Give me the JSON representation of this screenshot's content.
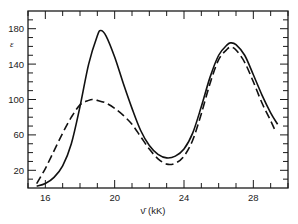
{
  "chart_data": {
    "type": "line",
    "title": "",
    "xlabel": "ν̄ (kK)",
    "ylabel": "ε",
    "xlim": [
      15.0,
      30.0
    ],
    "ylim": [
      0,
      200
    ],
    "xticks_major": [
      16,
      20,
      24,
      28
    ],
    "xticks_minor_step": 1,
    "yticks_major": [
      20,
      60,
      100,
      140,
      180
    ],
    "yticks_minor_step": 10,
    "grid": false,
    "legend": null,
    "series": [
      {
        "name": "solid",
        "style": "solid",
        "x": [
          15.5,
          16.0,
          16.5,
          17.0,
          17.5,
          18.0,
          18.5,
          19.0,
          19.2,
          19.5,
          20.0,
          20.5,
          21.0,
          21.5,
          22.0,
          22.5,
          23.0,
          23.5,
          24.0,
          24.5,
          25.0,
          25.5,
          26.0,
          26.5,
          26.7,
          27.0,
          27.5,
          28.0,
          28.5,
          29.0,
          29.4
        ],
        "y": [
          2,
          5,
          12,
          25,
          50,
          92,
          140,
          172,
          178,
          172,
          148,
          118,
          90,
          65,
          48,
          38,
          34,
          36,
          44,
          62,
          92,
          125,
          150,
          162,
          164,
          162,
          150,
          128,
          105,
          85,
          72
        ]
      },
      {
        "name": "dashed",
        "style": "dashed",
        "x": [
          15.5,
          16.0,
          16.5,
          17.0,
          17.5,
          18.0,
          18.5,
          18.7,
          19.0,
          19.5,
          20.0,
          20.5,
          21.0,
          21.5,
          22.0,
          22.5,
          23.0,
          23.5,
          24.0,
          24.5,
          25.0,
          25.5,
          26.0,
          26.5,
          26.7,
          27.0,
          27.5,
          28.0,
          28.5,
          29.0,
          29.3
        ],
        "y": [
          5,
          22,
          42,
          62,
          80,
          94,
          99,
          100,
          99,
          96,
          90,
          82,
          72,
          58,
          44,
          33,
          27,
          28,
          36,
          54,
          84,
          118,
          145,
          157,
          159,
          156,
          142,
          120,
          96,
          76,
          63
        ]
      }
    ]
  }
}
